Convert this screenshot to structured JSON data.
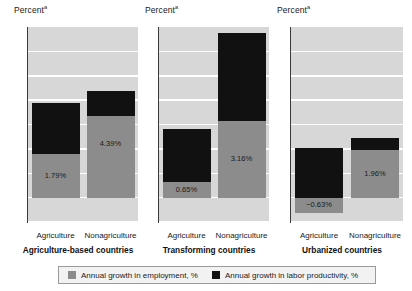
{
  "axis_title": "Percent",
  "axis_title_superscript": "a",
  "y_ticks": [
    "7",
    "6",
    "5",
    "4",
    "3",
    "2",
    "1",
    "0",
    "−1"
  ],
  "legend": {
    "employment": {
      "label": "Annual growth in employment, %",
      "color": "#8c8c8c",
      "icon": "legend-swatch-employment"
    },
    "productivity": {
      "label": "Annual growth in labor productivity, %",
      "color": "#111111",
      "icon": "legend-swatch-productivity"
    }
  },
  "panels": [
    {
      "title": "Agriculture-based countries",
      "categories": [
        "Agriculture",
        "Nonagriculture"
      ],
      "bars": [
        {
          "category": "Agriculture",
          "employment": 1.79,
          "productivity": 2.11,
          "total": 3.9,
          "label": "1.79%"
        },
        {
          "category": "Nonagriculture",
          "employment": 4.39,
          "productivity": -1.05,
          "total": 3.34,
          "label": "4.39%"
        }
      ]
    },
    {
      "title": "Transforming countries",
      "categories": [
        "Agriculture",
        "Nonagriculture"
      ],
      "bars": [
        {
          "category": "Agriculture",
          "employment": 0.65,
          "productivity": 2.15,
          "total": 2.8,
          "label": "0.65%"
        },
        {
          "category": "Nonagriculture",
          "employment": 3.16,
          "productivity": 3.59,
          "total": 6.75,
          "label": "3.16%"
        }
      ]
    },
    {
      "title": "Urbanized countries",
      "categories": [
        "Agriculture",
        "Nonagriculture"
      ],
      "bars": [
        {
          "category": "Agriculture",
          "employment": -0.63,
          "productivity": 2.05,
          "total": 1.42,
          "label": "−0.63%"
        },
        {
          "category": "Nonagriculture",
          "employment": 1.96,
          "productivity": 0.49,
          "total": 2.45,
          "label": "1.96%"
        }
      ]
    }
  ],
  "chart_data": {
    "type": "bar",
    "title": "",
    "subtitle": "",
    "xlabel": "",
    "ylabel": "Percent",
    "ylim": [
      -1,
      7
    ],
    "ytick_values": [
      -1,
      0,
      1,
      2,
      3,
      4,
      5,
      6,
      7
    ],
    "grid": true,
    "stacked": true,
    "legend_position": "bottom",
    "panels": [
      {
        "panel_title": "Agriculture-based countries",
        "categories": [
          "Agriculture",
          "Nonagriculture"
        ],
        "series": [
          {
            "name": "Annual growth in employment, %",
            "values": [
              1.79,
              4.39
            ],
            "color": "#8c8c8c"
          },
          {
            "name": "Annual growth in labor productivity, %",
            "values": [
              2.11,
              -1.05
            ],
            "color": "#111111"
          }
        ],
        "annotations": [
          "1.79%",
          "4.39%"
        ]
      },
      {
        "panel_title": "Transforming countries",
        "categories": [
          "Agriculture",
          "Nonagriculture"
        ],
        "series": [
          {
            "name": "Annual growth in employment, %",
            "values": [
              0.65,
              3.16
            ],
            "color": "#8c8c8c"
          },
          {
            "name": "Annual growth in labor productivity, %",
            "values": [
              2.15,
              3.59
            ],
            "color": "#111111"
          }
        ],
        "annotations": [
          "0.65%",
          "3.16%"
        ]
      },
      {
        "panel_title": "Urbanized countries",
        "categories": [
          "Agriculture",
          "Nonagriculture"
        ],
        "series": [
          {
            "name": "Annual growth in employment, %",
            "values": [
              -0.63,
              1.96
            ],
            "color": "#8c8c8c"
          },
          {
            "name": "Annual growth in labor productivity, %",
            "values": [
              2.05,
              0.49
            ],
            "color": "#111111"
          }
        ],
        "annotations": [
          "−0.63%",
          "1.96%"
        ]
      }
    ]
  }
}
